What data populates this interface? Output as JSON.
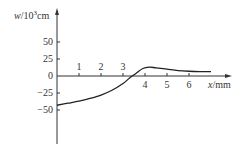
{
  "chart_data": {
    "type": "line",
    "title": "",
    "xlabel": "x/mm",
    "ylabel": "w/10^3 cm",
    "ylabel_parts": {
      "var": "w",
      "slash": "/10",
      "exp": "3",
      "unit": "cm"
    },
    "xlabel_parts": {
      "var": "x",
      "unit": "/mm"
    },
    "x_ticks": [
      "1",
      "2",
      "3",
      "4",
      "5",
      "6"
    ],
    "y_ticks": [
      "50",
      "25",
      "0",
      "−25",
      "−50"
    ],
    "xlim": [
      0,
      7
    ],
    "ylim": [
      -90,
      65
    ],
    "grid": false,
    "series": [
      {
        "name": "w",
        "x": [
          0,
          0.5,
          1.0,
          1.5,
          2.0,
          2.5,
          3.0,
          3.3,
          3.6,
          3.9,
          4.2,
          4.5,
          5.0,
          5.5,
          6.0,
          6.5,
          7.0
        ],
        "values": [
          -43,
          -40,
          -37,
          -33,
          -28,
          -21,
          -11,
          -3,
          4,
          11,
          13,
          12,
          10,
          8,
          7,
          6.5,
          6.5
        ]
      }
    ]
  }
}
